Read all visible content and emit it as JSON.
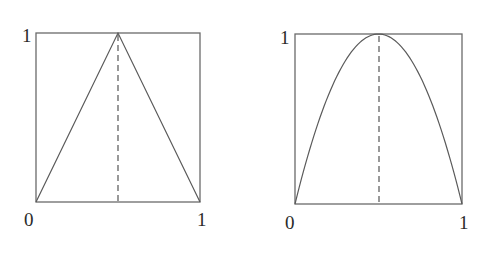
{
  "chart_data": [
    {
      "type": "line",
      "title": "Tent map",
      "name": "tent-map",
      "function": "f(x) = 1 - |2x - 1|",
      "x": [
        0,
        0.5,
        1
      ],
      "y": [
        0,
        1,
        0
      ],
      "xlim": [
        0,
        1
      ],
      "ylim": [
        0,
        1
      ],
      "dashed_vline_at": 0.5,
      "tick_labels": {
        "origin": "0",
        "x_max": "1",
        "y_max": "1"
      },
      "grid": false
    },
    {
      "type": "line",
      "title": "Logistic map",
      "name": "logistic-map",
      "function": "f(x) = 4x(1 - x)",
      "x": [
        0,
        0.1,
        0.2,
        0.3,
        0.4,
        0.5,
        0.6,
        0.7,
        0.8,
        0.9,
        1
      ],
      "y": [
        0,
        0.36,
        0.64,
        0.84,
        0.96,
        1,
        0.96,
        0.84,
        0.64,
        0.36,
        0
      ],
      "xlim": [
        0,
        1
      ],
      "ylim": [
        0,
        1
      ],
      "dashed_vline_at": 0.5,
      "tick_labels": {
        "origin": "0",
        "x_max": "1",
        "y_max": "1"
      },
      "grid": false
    }
  ],
  "labels": {
    "left": {
      "y_max": "1",
      "origin": "0",
      "x_max": "1"
    },
    "right": {
      "y_max": "1",
      "origin": "0",
      "x_max": "1"
    }
  }
}
